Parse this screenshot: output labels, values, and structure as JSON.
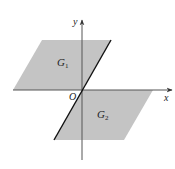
{
  "diagram": {
    "labels": {
      "y_axis": "y",
      "x_axis": "x",
      "origin": "O",
      "region1": "G",
      "region1_sub": "1",
      "region2": "G",
      "region2_sub": "2"
    },
    "colors": {
      "region_fill": "#c4c4c4",
      "axis": "#333333",
      "boundary": "#111111",
      "background": "#ffffff"
    },
    "regions": [
      {
        "name": "G1",
        "vertices": [
          [
            42,
            40
          ],
          [
            111,
            40
          ],
          [
            82,
            90
          ],
          [
            13,
            90
          ]
        ]
      },
      {
        "name": "G2",
        "vertices": [
          [
            82,
            90
          ],
          [
            153,
            90
          ],
          [
            124,
            140
          ],
          [
            54,
            140
          ]
        ]
      }
    ],
    "boundary_line": {
      "from": [
        111,
        40
      ],
      "to": [
        54,
        140
      ]
    }
  }
}
